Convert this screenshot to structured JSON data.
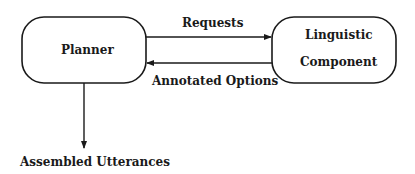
{
  "nodes": {
    "planner": {
      "label": "Planner"
    },
    "linguistic": {
      "line1": "Linguistic",
      "line2": "Component"
    }
  },
  "edges": {
    "requests": {
      "label": "Requests",
      "from": "Planner",
      "to": "Linguistic Component"
    },
    "annotated_options": {
      "label": "Annotated Options",
      "from": "Linguistic Component",
      "to": "Planner"
    },
    "output": {
      "label": "Assembled Utterances",
      "from": "Planner"
    }
  },
  "colors": {
    "stroke": "#1a1a1a",
    "background": "#ffffff"
  }
}
